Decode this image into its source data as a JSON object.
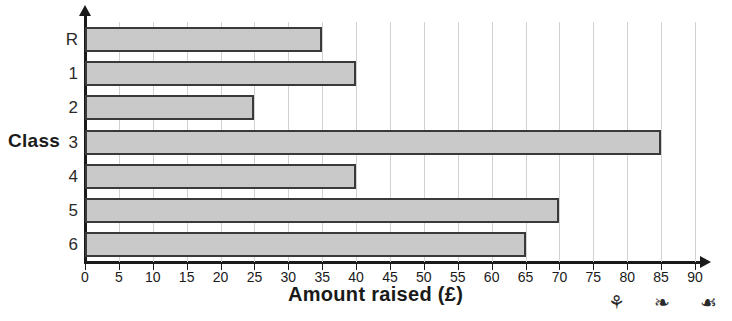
{
  "chart_data": {
    "type": "bar",
    "orientation": "horizontal",
    "title": "",
    "xlabel": "Amount raised (£)",
    "ylabel": "Class",
    "categories": [
      "R",
      "1",
      "2",
      "3",
      "4",
      "5",
      "6"
    ],
    "values": [
      35,
      40,
      25,
      85,
      40,
      70,
      65
    ],
    "series": [
      {
        "name": "Amount raised",
        "values": [
          35,
          40,
          25,
          85,
          40,
          70,
          65
        ]
      }
    ],
    "xlim": [
      0,
      90
    ],
    "xticks": [
      0,
      5,
      10,
      15,
      20,
      25,
      30,
      35,
      40,
      45,
      50,
      55,
      60,
      65,
      70,
      75,
      80,
      85,
      90
    ],
    "xtick_labels": [
      "0",
      "5",
      "10",
      "15",
      "20",
      "25",
      "30",
      "35",
      "40",
      "45",
      "50",
      "55",
      "60",
      "65",
      "70",
      "75",
      "80",
      "85",
      "90"
    ],
    "grid": "vertical",
    "legend": "none",
    "bar_fill_color": "#c9c9c9",
    "bar_border_color": "#3a3a3a",
    "gridline_color": "#d2d2d2",
    "axis_color": "#1a1a1a"
  },
  "labels": {
    "y_axis_caption": "Class",
    "x_axis_caption": "Amount raised (£)",
    "title_stub": ""
  },
  "decorations": {
    "doodles": [
      {
        "name": "leaf-doodle-icon",
        "glyph": "⚘"
      },
      {
        "name": "fish-doodle-icon",
        "glyph": "❧"
      },
      {
        "name": "leaf-doodle-icon-2",
        "glyph": "☙"
      }
    ]
  }
}
